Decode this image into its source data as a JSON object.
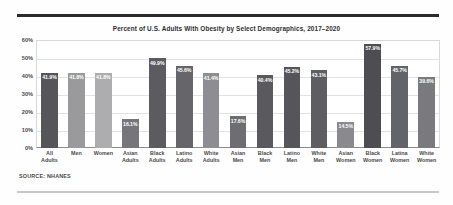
{
  "figure": {
    "source_note": "SOURCE: NHANES"
  },
  "chart_data": {
    "type": "bar",
    "title": "Percent of U.S. Adults With Obesity by Select Demographics, 2017–2020",
    "xlabel": "",
    "ylabel": "",
    "ylim": [
      0,
      60
    ],
    "grid": true,
    "legend": "none",
    "ytick_labels": [
      "60%",
      "50%",
      "40%",
      "30%",
      "20%",
      "10%",
      "0%"
    ],
    "ytick_values": [
      60,
      50,
      40,
      30,
      20,
      10,
      0
    ],
    "value_label_suffix": "%",
    "categories": [
      "All Adults",
      "Men",
      "Women",
      "Asian Adults",
      "Black Adults",
      "Latino Adults",
      "White Adults",
      "Asian Men",
      "Black Men",
      "Latino Men",
      "White Men",
      "Asian Women",
      "Black Women",
      "Latina Women",
      "White Women"
    ],
    "category_lines": [
      [
        "All",
        "Adults"
      ],
      [
        "Men",
        ""
      ],
      [
        "Women",
        ""
      ],
      [
        "Asian",
        "Adults"
      ],
      [
        "Black",
        "Adults"
      ],
      [
        "Latino",
        "Adults"
      ],
      [
        "White",
        "Adults"
      ],
      [
        "Asian",
        "Men"
      ],
      [
        "Black",
        "Men"
      ],
      [
        "Latino",
        "Men"
      ],
      [
        "White",
        "Men"
      ],
      [
        "Asian",
        "Women"
      ],
      [
        "Black",
        "Women"
      ],
      [
        "Latina",
        "Women"
      ],
      [
        "White",
        "Women"
      ]
    ],
    "values": [
      41.9,
      41.8,
      41.8,
      16.1,
      49.9,
      45.6,
      41.4,
      17.6,
      40.4,
      45.2,
      43.1,
      14.5,
      57.9,
      45.7,
      39.6
    ],
    "value_labels": [
      "41.9%",
      "41.8%",
      "41.8%",
      "16.1%",
      "49.9%",
      "45.6%",
      "41.4%",
      "17.6%",
      "40.4%",
      "45.2%",
      "43.1%",
      "14.5%",
      "57.9%",
      "45.7%",
      "39.6%"
    ],
    "bar_colors": [
      "#56565a",
      "#9a9a9d",
      "#adadb0",
      "#76767a",
      "#5c5c60",
      "#66666a",
      "#8e8e92",
      "#6e6e72",
      "#5a5a5e",
      "#56565a",
      "#5e5e62",
      "#8a8a8e",
      "#4e4e52",
      "#63636a",
      "#79797e"
    ]
  }
}
